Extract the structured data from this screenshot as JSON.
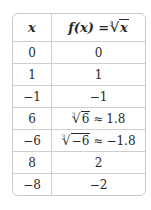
{
  "table": {
    "headers": {
      "x": "x",
      "fx": "f(x) = ",
      "fx_radical_index": "3",
      "fx_radical_arg": "x"
    },
    "rows": [
      {
        "x": "0",
        "fx": "0"
      },
      {
        "x": "1",
        "fx": "1"
      },
      {
        "x": "−1",
        "fx": "−1"
      },
      {
        "x": "6",
        "fx_radical_index": "3",
        "fx_radical_arg": "6",
        "fx_approx": "≈",
        "fx_value": "1.8"
      },
      {
        "x": "−6",
        "fx_radical_index": "3",
        "fx_radical_arg": "−6",
        "fx_approx": "≈",
        "fx_value": "−1.8"
      },
      {
        "x": "8",
        "fx": "2"
      },
      {
        "x": "−8",
        "fx": "−2"
      }
    ]
  }
}
